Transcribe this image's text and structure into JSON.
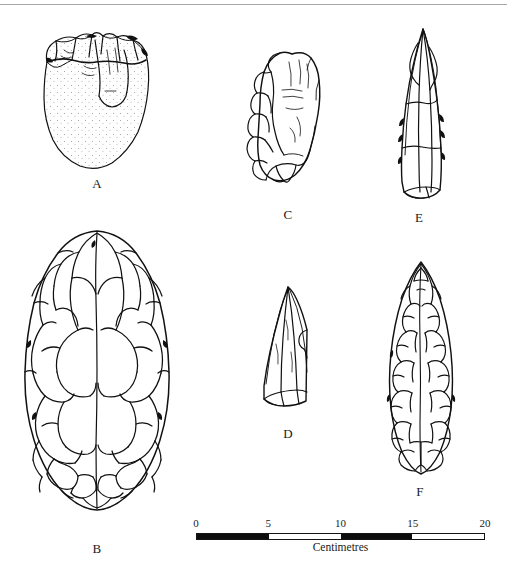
{
  "figure": {
    "kind": "lithic-artefact-plate",
    "background_color": "#ffffff",
    "ink_color": "#111111"
  },
  "top_rule": {
    "color": "#a8a8a8"
  },
  "artefacts": [
    {
      "label": "A",
      "name": "core-chopper",
      "description": "Flaked core with stippled cortical surface",
      "label_x": 97,
      "label_y": 176
    },
    {
      "label": "B",
      "name": "large-handaxe-biface",
      "description": "Large teardrop handaxe with extensive flake scars",
      "label_x": 97,
      "label_y": 541
    },
    {
      "label": "C",
      "name": "crescent-sidescraper",
      "description": "Crescentic side scraper with stepped retouch along left edge",
      "label_x": 288,
      "label_y": 207
    },
    {
      "label": "D",
      "name": "triangular-point",
      "description": "Triangular point on blade",
      "label_x": 288,
      "label_y": 426
    },
    {
      "label": "E",
      "name": "elongated-blade-point",
      "description": "Slender elongated blade point",
      "label_x": 419,
      "label_y": 210
    },
    {
      "label": "F",
      "name": "lanceolate-biface",
      "description": "Leaf-shaped lanceolate biface, fully flaked",
      "label_x": 420,
      "label_y": 484
    }
  ],
  "scale": {
    "caption": "Centimetres",
    "unit": "cm",
    "min": 0,
    "max": 20,
    "tick_labels": [
      "0",
      "5",
      "10",
      "15",
      "20"
    ],
    "tick_values": [
      0,
      5,
      10,
      15,
      20
    ],
    "filled_segments": [
      [
        0,
        5
      ],
      [
        10,
        15
      ]
    ],
    "bar_color": "#0d0d0d",
    "bar_left_px": 196,
    "bar_width_px": 289
  }
}
